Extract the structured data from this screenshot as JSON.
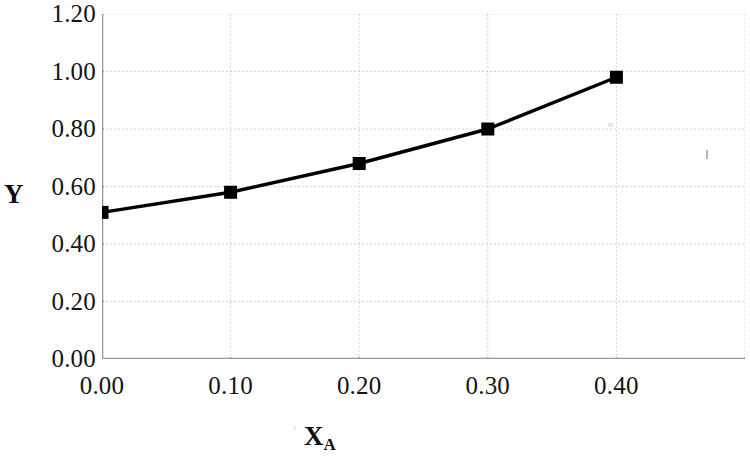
{
  "chart_data": {
    "type": "line",
    "title": "",
    "xlabel": "X_A",
    "xlabel_base": "X",
    "xlabel_sub": "A",
    "ylabel": "Y",
    "x": [
      0.0,
      0.1,
      0.2,
      0.3,
      0.4
    ],
    "values": [
      0.51,
      0.58,
      0.68,
      0.8,
      0.98
    ],
    "series": [
      {
        "name": "Y",
        "x": [
          0.0,
          0.1,
          0.2,
          0.3,
          0.4
        ],
        "values": [
          0.51,
          0.58,
          0.68,
          0.8,
          0.98
        ]
      }
    ],
    "xlim": [
      0.0,
      0.5
    ],
    "ylim": [
      0.0,
      1.2
    ],
    "xticks": [
      0.0,
      0.1,
      0.2,
      0.3,
      0.4,
      0.5
    ],
    "xtick_labels": [
      "0.00",
      "0.10",
      "0.20",
      "0.30",
      "0.40",
      ""
    ],
    "yticks": [
      0.0,
      0.2,
      0.4,
      0.6,
      0.8,
      1.0,
      1.2
    ],
    "ytick_labels": [
      "0.00",
      "0.20",
      "0.40",
      "0.60",
      "0.80",
      "1.00",
      "1.20"
    ],
    "grid": true,
    "grid_style": "dotted",
    "legend": false,
    "legend_position": "none",
    "marker": "filled-square",
    "line_color": "#000000",
    "marker_color": "#000000",
    "grid_color": "#c8c8c8",
    "axis_color": "#9a9a9a",
    "background": "#ffffff"
  }
}
